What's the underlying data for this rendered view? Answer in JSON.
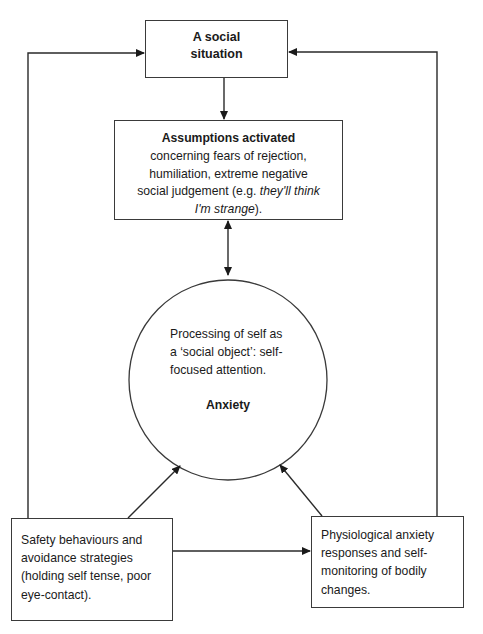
{
  "diagram": {
    "type": "cognitive model flow diagram",
    "colors": {
      "line": "#2a2a2a",
      "text": "#1a1a1a",
      "background": "#ffffff"
    },
    "nodes": {
      "social_situation": {
        "title_line1": "A social",
        "title_line2": "situation"
      },
      "assumptions": {
        "title": "Assumptions activated",
        "line1": "concerning fears of rejection,",
        "line2": "humiliation, extreme negative",
        "line3_prefix": "social judgement (e.g. ",
        "line3_italic": "they'll think",
        "line4_italic": "I'm strange",
        "line4_suffix": ")."
      },
      "self_processing": {
        "line1": "Processing of self as",
        "line2": "a ‘social object’: self-",
        "line3": "focused attention.",
        "emphasis": "Anxiety"
      },
      "safety_behaviours": {
        "line1": "Safety behaviours and",
        "line2": "avoidance strategies",
        "line3": "(holding self tense, poor",
        "line4": "eye-contact)."
      },
      "physiological": {
        "line1": "Physiological anxiety",
        "line2": "responses and self-",
        "line3": "monitoring of bodily",
        "line4": "changes."
      }
    },
    "edges": [
      {
        "from": "social_situation",
        "to": "assumptions",
        "direction": "one-way"
      },
      {
        "from": "assumptions",
        "to": "self_processing",
        "direction": "two-way"
      },
      {
        "from": "safety_behaviours",
        "to": "self_processing",
        "direction": "one-way"
      },
      {
        "from": "physiological",
        "to": "self_processing",
        "direction": "one-way"
      },
      {
        "from": "safety_behaviours",
        "to": "physiological",
        "direction": "one-way"
      },
      {
        "from": "safety_behaviours",
        "to": "social_situation",
        "direction": "one-way"
      },
      {
        "from": "physiological",
        "to": "social_situation",
        "direction": "one-way"
      }
    ]
  }
}
